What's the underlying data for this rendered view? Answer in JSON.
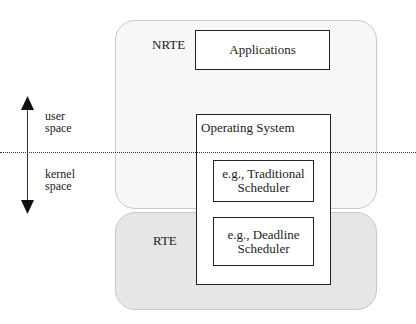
{
  "regions": {
    "nrte": {
      "label": "NRTE",
      "color": "#f7f7f7"
    },
    "rte": {
      "label": "RTE",
      "color": "#e6e6e6"
    }
  },
  "boxes": {
    "applications": "Applications",
    "os": "Operating System",
    "traditional": [
      "e.g., Traditional",
      "Scheduler"
    ],
    "deadline": [
      "e.g., Deadline",
      "Scheduler"
    ]
  },
  "axis": {
    "user": [
      "user",
      "space"
    ],
    "kernel": [
      "kernel",
      "space"
    ]
  }
}
